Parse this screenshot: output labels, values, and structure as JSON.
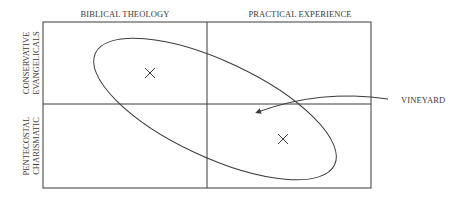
{
  "diagram": {
    "columns": [
      {
        "label": "BIBLICAL THEOLOGY"
      },
      {
        "label": "PRACTICAL EXPERIENCE"
      }
    ],
    "rows": [
      {
        "label_line1": "CONSERVATIVE",
        "label_line2": "EVANGELICALS"
      },
      {
        "label_line1": "PENTECOSTAL",
        "label_line2": "CHARISMATIC"
      }
    ],
    "markers": [
      {
        "symbol": "×",
        "quadrant": "top-left"
      },
      {
        "symbol": "×",
        "quadrant": "bottom-right"
      }
    ],
    "callout": {
      "label": "VINEYARD"
    },
    "colors": {
      "line": "#3a3a3a",
      "background": "#ffffff"
    }
  }
}
